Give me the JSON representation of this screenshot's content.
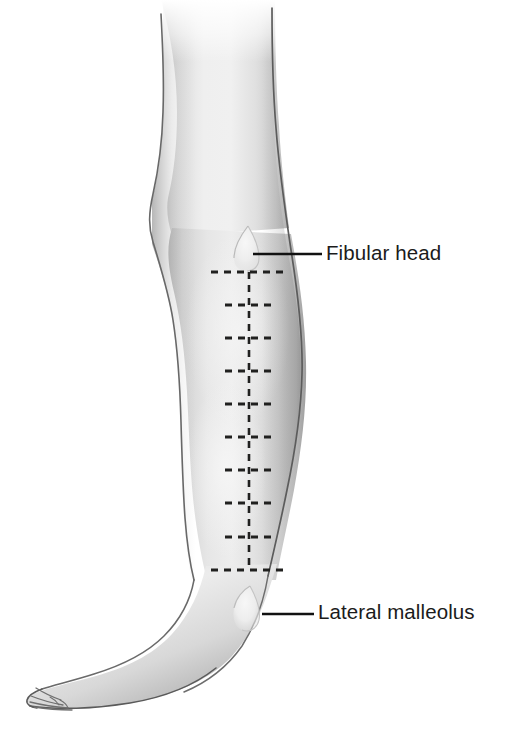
{
  "figure": {
    "name": "lateral-view-right-lower-limb",
    "background_color": "#ffffff",
    "width": 506,
    "height": 730,
    "orientation": "foot pointing to the left, leg viewed from lateral side"
  },
  "labels": [
    {
      "id": "fibular-head",
      "text": "Fibular head",
      "text_color": "#1b1b1b",
      "font_size_px": 20.5,
      "text_x": 326,
      "text_y": 243,
      "leader_line": {
        "x1": 253,
        "y1": 254,
        "x2": 322,
        "y2": 254,
        "color": "#111111",
        "width": 2.6
      }
    },
    {
      "id": "lateral-malleolus",
      "text": "Lateral malleolus",
      "text_color": "#1b1b1b",
      "font_size_px": 20.5,
      "text_x": 318,
      "text_y": 602,
      "leader_line": {
        "x1": 262,
        "y1": 614,
        "x2": 314,
        "y2": 614,
        "color": "#111111",
        "width": 2.6
      }
    }
  ],
  "landmarks": [
    {
      "id": "fibular-head-bump",
      "name": "fibular head",
      "shape": "teardrop highlight",
      "center_x": 247,
      "center_y": 245,
      "fill": "#ececed"
    },
    {
      "id": "lateral-malleolus-bump",
      "name": "lateral malleolus",
      "shape": "teardrop highlight",
      "center_x": 248,
      "center_y": 606,
      "fill": "#ebebec"
    }
  ],
  "measurement_ladder": {
    "name": "dashed measurement ladder",
    "axis_x": 249,
    "axis_top_y": 272,
    "axis_bottom_y": 570,
    "stroke_color": "#20201f",
    "axis_dash_pattern": "7 6",
    "axis_stroke_width": 2.6,
    "tick_stroke_width": 2.9,
    "tick_dash_pattern": "7 6",
    "end_tick_half_width": 38,
    "mid_tick_half_width": 24,
    "tick_count": 10,
    "tick_spacing_px": 33.1,
    "ticks": [
      {
        "index": 1,
        "y": 272,
        "type": "end",
        "half_width": 38
      },
      {
        "index": 2,
        "y": 305,
        "type": "mid",
        "half_width": 24
      },
      {
        "index": 3,
        "y": 338,
        "type": "mid",
        "half_width": 24
      },
      {
        "index": 4,
        "y": 371,
        "type": "mid",
        "half_width": 24
      },
      {
        "index": 5,
        "y": 404,
        "type": "mid",
        "half_width": 24
      },
      {
        "index": 6,
        "y": 437,
        "type": "mid",
        "half_width": 24
      },
      {
        "index": 7,
        "y": 470,
        "type": "mid",
        "half_width": 24
      },
      {
        "index": 8,
        "y": 503,
        "type": "mid",
        "half_width": 24
      },
      {
        "index": 9,
        "y": 537,
        "type": "mid",
        "half_width": 24
      },
      {
        "index": 10,
        "y": 570,
        "type": "end",
        "half_width": 38
      }
    ]
  },
  "palette": {
    "skin_light": "#f2f2f2",
    "skin_mid": "#d9d9d9",
    "skin_shadow": "#b4b4b4",
    "skin_deep_shadow": "#8e8e8e",
    "outline": "#6a6a6a",
    "outline_dark": "#3d3d3d",
    "ink": "#1b1b1b",
    "background": "#ffffff"
  }
}
